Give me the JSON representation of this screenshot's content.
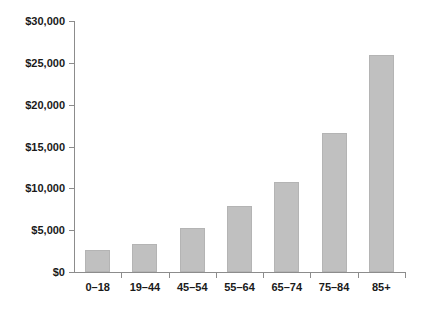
{
  "chart_data": {
    "type": "bar",
    "title": "",
    "subtitle": "",
    "xlabel": "",
    "ylabel": "",
    "categories": [
      "0–18",
      "19–44",
      "45–54",
      "55–64",
      "65–74",
      "75–84",
      "85+"
    ],
    "values": [
      2600,
      3400,
      5250,
      7900,
      10800,
      16600,
      25900
    ],
    "ylim": [
      0,
      30000
    ],
    "ytick_values": [
      0,
      5000,
      10000,
      15000,
      20000,
      25000,
      30000
    ],
    "ytick_labels": [
      "$0",
      "$5,000",
      "$10,000",
      "$15,000",
      "$20,000",
      "$25,000",
      "$30,000"
    ],
    "grid": false,
    "legend": false,
    "legend_position": "none",
    "bar_color": "#c0c0c0",
    "bar_edge_color": "#b4b4b4",
    "axis_color": "#8c8c8c",
    "text_color": "#1a1a1a",
    "background_color": "#ffffff"
  }
}
